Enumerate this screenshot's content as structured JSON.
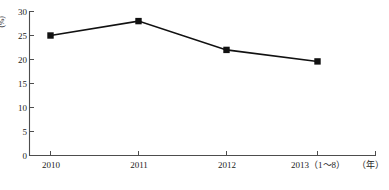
{
  "chart_data": {
    "type": "line",
    "title": "",
    "subtitle": "",
    "xlabel": "(年)",
    "ylabel": "(%)",
    "categories": [
      "2010",
      "2011",
      "2012",
      "2013（1～8）"
    ],
    "values": [
      25.0,
      28.0,
      22.0,
      19.6
    ],
    "series": [
      {
        "name": "",
        "values": [
          25.0,
          28.0,
          22.0,
          19.6
        ],
        "marker": "filled-square",
        "color": "#111111"
      }
    ],
    "ylim": [
      0,
      30
    ],
    "yticks": [
      0,
      5,
      10,
      15,
      20,
      25,
      30
    ],
    "ytick_labels": [
      "0",
      "5",
      "10",
      "15",
      "20",
      "25",
      "30"
    ],
    "xtick_labels": [
      "2010",
      "2011",
      "2012",
      "2013（1～8）"
    ],
    "grid": false,
    "legend": "none",
    "line_color": "#111111",
    "marker_color": "#111111",
    "axis_color": "#555555",
    "background": "#ffffff"
  },
  "axes": {
    "y_unit_label": "(%)",
    "x_unit_label": "（年）"
  },
  "yticks": {
    "t0": "0",
    "t1": "5",
    "t2": "10",
    "t3": "15",
    "t4": "20",
    "t5": "25",
    "t6": "30"
  },
  "xticks": {
    "t0": "2010",
    "t1": "2011",
    "t2": "2012",
    "t3": "2013（1～8）"
  },
  "caption": {
    "text": ""
  }
}
